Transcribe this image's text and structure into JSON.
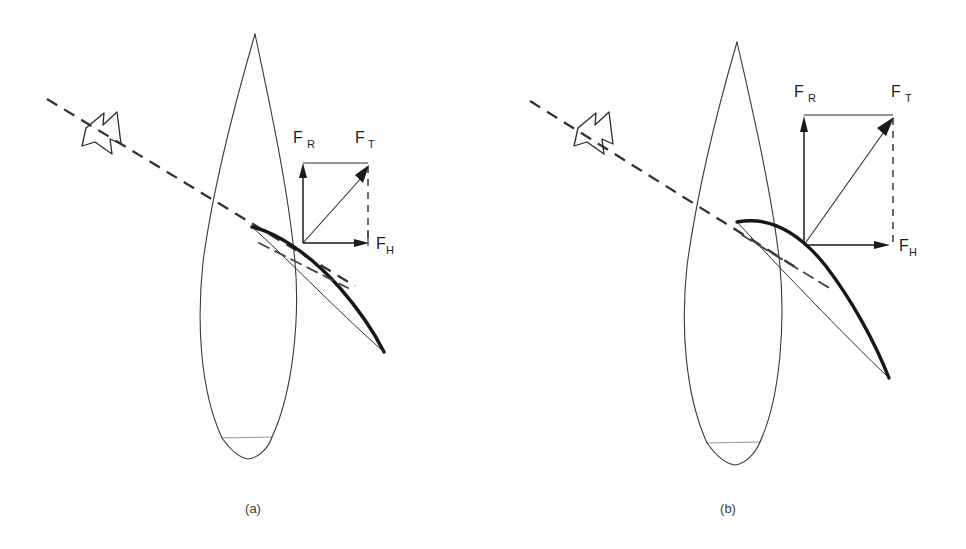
{
  "figure": {
    "width": 966,
    "height": 549,
    "background": "#ffffff",
    "ink_color": "#2a2a2a"
  },
  "panels": [
    {
      "id": "a",
      "caption": "(a)",
      "sail_type": "flat sail",
      "force_labels": {
        "resultant": "F",
        "resultant_sub": "R",
        "total": "F",
        "total_sub": "T",
        "heeling": "F",
        "heeling_sub": "H"
      },
      "wind_label": "apparent wind",
      "vectors": {
        "origin": [
          303,
          243
        ],
        "FR_tip": [
          303,
          164
        ],
        "FT_tip": [
          368,
          164
        ],
        "FH_tip": [
          368,
          243
        ]
      }
    },
    {
      "id": "b",
      "caption": "(b)",
      "sail_type": "full (cambered) sail",
      "force_labels": {
        "resultant": "F",
        "resultant_sub": "R",
        "total": "F",
        "total_sub": "T",
        "heeling": "F",
        "heeling_sub": "H"
      },
      "wind_label": "apparent wind",
      "vectors": {
        "origin": [
          804,
          245
        ],
        "FR_tip": [
          804,
          118
        ],
        "FT_tip": [
          893,
          115
        ],
        "FH_tip": [
          890,
          245
        ]
      }
    }
  ],
  "elements": {
    "hull_name": "boat-hull-plan-view",
    "sail_name": "sail-section",
    "wind_name": "apparent-wind-direction-line",
    "wind_arrow_name": "wind-arrow-glyph"
  }
}
